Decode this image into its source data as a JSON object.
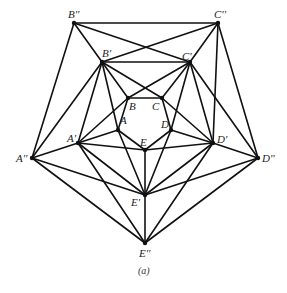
{
  "diagram": {
    "type": "graph",
    "caption": "(a)",
    "vertices": [
      {
        "id": "A",
        "label": "A",
        "x": 118,
        "y": 130,
        "lx": 120,
        "ly": 124
      },
      {
        "id": "B",
        "label": "B",
        "x": 128,
        "y": 98,
        "lx": 129,
        "ly": 110
      },
      {
        "id": "C",
        "label": "C",
        "x": 162,
        "y": 98,
        "lx": 152,
        "ly": 110
      },
      {
        "id": "D",
        "label": "D",
        "x": 171,
        "y": 130,
        "lx": 161,
        "ly": 128
      },
      {
        "id": "E",
        "label": "E",
        "x": 145,
        "y": 150,
        "lx": 140,
        "ly": 146
      },
      {
        "id": "A1",
        "label": "A'",
        "x": 78,
        "y": 143,
        "lx": 67,
        "ly": 142
      },
      {
        "id": "B1",
        "label": "B'",
        "x": 102,
        "y": 62,
        "lx": 102,
        "ly": 57
      },
      {
        "id": "C1",
        "label": "C'",
        "x": 190,
        "y": 62,
        "lx": 182,
        "ly": 60
      },
      {
        "id": "D1",
        "label": "D'",
        "x": 213,
        "y": 143,
        "lx": 217,
        "ly": 143
      },
      {
        "id": "E1",
        "label": "E'",
        "x": 145,
        "y": 195,
        "lx": 131,
        "ly": 206
      },
      {
        "id": "A2",
        "label": "A''",
        "x": 32,
        "y": 158,
        "lx": 16,
        "ly": 162
      },
      {
        "id": "B2",
        "label": "B''",
        "x": 74,
        "y": 23,
        "lx": 68,
        "ly": 18
      },
      {
        "id": "C2",
        "label": "C''",
        "x": 218,
        "y": 23,
        "lx": 214,
        "ly": 18
      },
      {
        "id": "D2",
        "label": "D''",
        "x": 258,
        "y": 158,
        "lx": 262,
        "ly": 162
      },
      {
        "id": "E2",
        "label": "E''",
        "x": 145,
        "y": 243,
        "lx": 139,
        "ly": 257
      }
    ],
    "edges": [
      [
        "A",
        "B"
      ],
      [
        "B",
        "C"
      ],
      [
        "C",
        "D"
      ],
      [
        "D",
        "E"
      ],
      [
        "E",
        "A"
      ],
      [
        "A1",
        "B1"
      ],
      [
        "B1",
        "C1"
      ],
      [
        "C1",
        "D1"
      ],
      [
        "D1",
        "E1"
      ],
      [
        "E1",
        "A1"
      ],
      [
        "A2",
        "B2"
      ],
      [
        "B2",
        "C2"
      ],
      [
        "C2",
        "D2"
      ],
      [
        "D2",
        "E2"
      ],
      [
        "E2",
        "A2"
      ],
      [
        "A",
        "A1"
      ],
      [
        "B",
        "B1"
      ],
      [
        "C",
        "C1"
      ],
      [
        "D",
        "D1"
      ],
      [
        "E",
        "E1"
      ],
      [
        "A1",
        "A2"
      ],
      [
        "B1",
        "B2"
      ],
      [
        "C1",
        "C2"
      ],
      [
        "D1",
        "D2"
      ],
      [
        "E1",
        "E2"
      ],
      [
        "A1",
        "B"
      ],
      [
        "B1",
        "C"
      ],
      [
        "C1",
        "D"
      ],
      [
        "D1",
        "E"
      ],
      [
        "E1",
        "A"
      ],
      [
        "A1",
        "E"
      ],
      [
        "C1",
        "B"
      ],
      [
        "B1",
        "A"
      ],
      [
        "D1",
        "C"
      ],
      [
        "E1",
        "D"
      ],
      [
        "A2",
        "B1"
      ],
      [
        "B2",
        "C1"
      ],
      [
        "C2",
        "D1"
      ],
      [
        "D2",
        "E1"
      ],
      [
        "E2",
        "A1"
      ],
      [
        "A2",
        "E1"
      ],
      [
        "B1",
        "C2"
      ],
      [
        "C1",
        "D2"
      ],
      [
        "D1",
        "E2"
      ],
      [
        "E1",
        "A2"
      ]
    ]
  }
}
